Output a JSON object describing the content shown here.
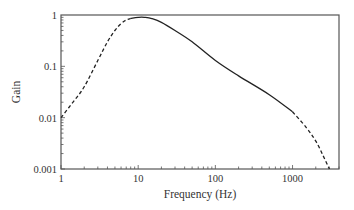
{
  "chart_data": {
    "type": "line",
    "title": "",
    "xlabel": "Frequency (Hz)",
    "ylabel": "Gain",
    "xscale": "log",
    "yscale": "log",
    "xlim": [
      1,
      4000
    ],
    "ylim": [
      0.001,
      1
    ],
    "xticks": [
      1,
      10,
      100,
      1000
    ],
    "xtick_labels": [
      "1",
      "10",
      "100",
      "1000"
    ],
    "yticks": [
      0.001,
      0.01,
      0.1,
      1
    ],
    "ytick_labels": [
      "0.001",
      "0.01",
      "0.1",
      "1"
    ],
    "grid": false,
    "legend": null,
    "series": [
      {
        "name": "low-frequency (dashed)",
        "style": "dashed",
        "x": [
          1,
          1.5,
          2,
          3,
          4,
          5,
          6,
          7,
          8
        ],
        "y": [
          0.01,
          0.022,
          0.04,
          0.13,
          0.3,
          0.5,
          0.68,
          0.8,
          0.86
        ]
      },
      {
        "name": "mid-frequency (solid)",
        "style": "solid",
        "x": [
          8,
          10,
          12,
          15,
          20,
          30,
          50,
          100,
          200,
          500,
          1000
        ],
        "y": [
          0.86,
          0.9,
          0.9,
          0.85,
          0.72,
          0.5,
          0.3,
          0.13,
          0.065,
          0.028,
          0.013
        ]
      },
      {
        "name": "high-frequency (dashed)",
        "style": "dashed",
        "x": [
          1000,
          1500,
          2000,
          2500,
          3000
        ],
        "y": [
          0.013,
          0.0065,
          0.0035,
          0.0018,
          0.001
        ]
      }
    ]
  },
  "axes": {
    "x_title": "Frequency (Hz)",
    "y_title": "Gain",
    "x_labels": [
      "1",
      "10",
      "100",
      "1000"
    ],
    "y_labels": [
      "1",
      "0.1",
      "0.01",
      "0.001"
    ]
  }
}
